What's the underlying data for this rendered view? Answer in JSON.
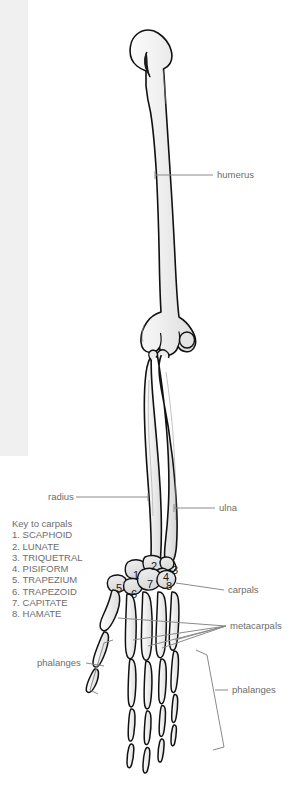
{
  "figure": {
    "colors": {
      "background": "#ffffff",
      "left_band": "#f0f0f1",
      "bone_fill": "#e9e9e9",
      "bone_fill_light": "#f4f4f4",
      "bone_outline": "#111111",
      "leader_line": "#8a8a8a",
      "label_text": "#6d6d6d",
      "number_text": "#1a1a1a"
    }
  },
  "labels": {
    "humerus": "humerus",
    "radius": "radius",
    "ulna": "ulna",
    "carpals": "carpals",
    "metacarpals": "metacarpals",
    "phalanges_left": "phalanges",
    "phalanges_right": "phalanges"
  },
  "key": {
    "title": "Key to carpals",
    "items": [
      "1. SCAPHOID",
      "2. LUNATE",
      "3. TRIQUETRAL",
      "4. PISIFORM",
      "5. TRAPEZIUM",
      "6. TRAPEZOID",
      "7. CAPITATE",
      "8. HAMATE"
    ]
  },
  "carpal_numbers": [
    {
      "n": "1",
      "x": 133,
      "y": 569
    },
    {
      "n": "2",
      "x": 151,
      "y": 560
    },
    {
      "n": "3",
      "x": 172,
      "y": 564
    },
    {
      "n": "4",
      "x": 163,
      "y": 571
    },
    {
      "n": "5",
      "x": 116,
      "y": 582
    },
    {
      "n": "6",
      "x": 131,
      "y": 588
    },
    {
      "n": "7",
      "x": 147,
      "y": 578
    },
    {
      "n": "8",
      "x": 166,
      "y": 580
    }
  ]
}
